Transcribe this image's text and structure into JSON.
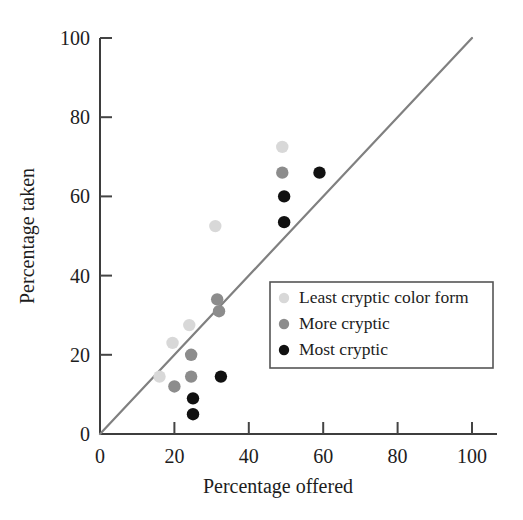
{
  "chart_data": {
    "type": "scatter",
    "title": "",
    "xlabel": "Percentage offered",
    "ylabel": "Percentage taken",
    "xlim": [
      0,
      100
    ],
    "ylim": [
      0,
      100
    ],
    "xticks": [
      0,
      20,
      40,
      60,
      80,
      100
    ],
    "yticks": [
      0,
      20,
      40,
      60,
      80,
      100
    ],
    "xtick_labels": [
      "0",
      "20",
      "40",
      "60",
      "80",
      "100"
    ],
    "ytick_labels": [
      "0",
      "20",
      "40",
      "60",
      "80",
      "100"
    ],
    "grid": false,
    "legend_position": "center-right",
    "reference_line": {
      "name": "1:1 line",
      "from": [
        0,
        0
      ],
      "to": [
        100,
        100
      ],
      "color": "#808080"
    },
    "series": [
      {
        "name": "Least cryptic color form",
        "color": "#d8d8d8",
        "points": [
          {
            "x": 16,
            "y": 14.5
          },
          {
            "x": 19.5,
            "y": 23
          },
          {
            "x": 24,
            "y": 27.5
          },
          {
            "x": 31,
            "y": 52.5
          },
          {
            "x": 49,
            "y": 72.5
          }
        ]
      },
      {
        "name": "More cryptic",
        "color": "#8c8c8c",
        "points": [
          {
            "x": 20,
            "y": 12
          },
          {
            "x": 24.5,
            "y": 14.5
          },
          {
            "x": 24.5,
            "y": 20
          },
          {
            "x": 31.5,
            "y": 34
          },
          {
            "x": 32,
            "y": 31
          },
          {
            "x": 49,
            "y": 66
          }
        ]
      },
      {
        "name": "Most cryptic",
        "color": "#111111",
        "points": [
          {
            "x": 25,
            "y": 5
          },
          {
            "x": 25,
            "y": 9
          },
          {
            "x": 32.5,
            "y": 14.5
          },
          {
            "x": 49.5,
            "y": 53.5
          },
          {
            "x": 49.5,
            "y": 60
          },
          {
            "x": 59,
            "y": 66
          }
        ]
      }
    ]
  },
  "legend": {
    "items": [
      {
        "label": "Least cryptic color form",
        "color": "#d8d8d8"
      },
      {
        "label": "More cryptic",
        "color": "#8c8c8c"
      },
      {
        "label": "Most cryptic",
        "color": "#111111"
      }
    ]
  },
  "axes": {
    "x_title": "Percentage offered",
    "y_title": "Percentage taken"
  },
  "colors": {
    "axis": "#444444",
    "reference_line": "#808080",
    "legend_border": "#555555",
    "background": "#ffffff"
  }
}
